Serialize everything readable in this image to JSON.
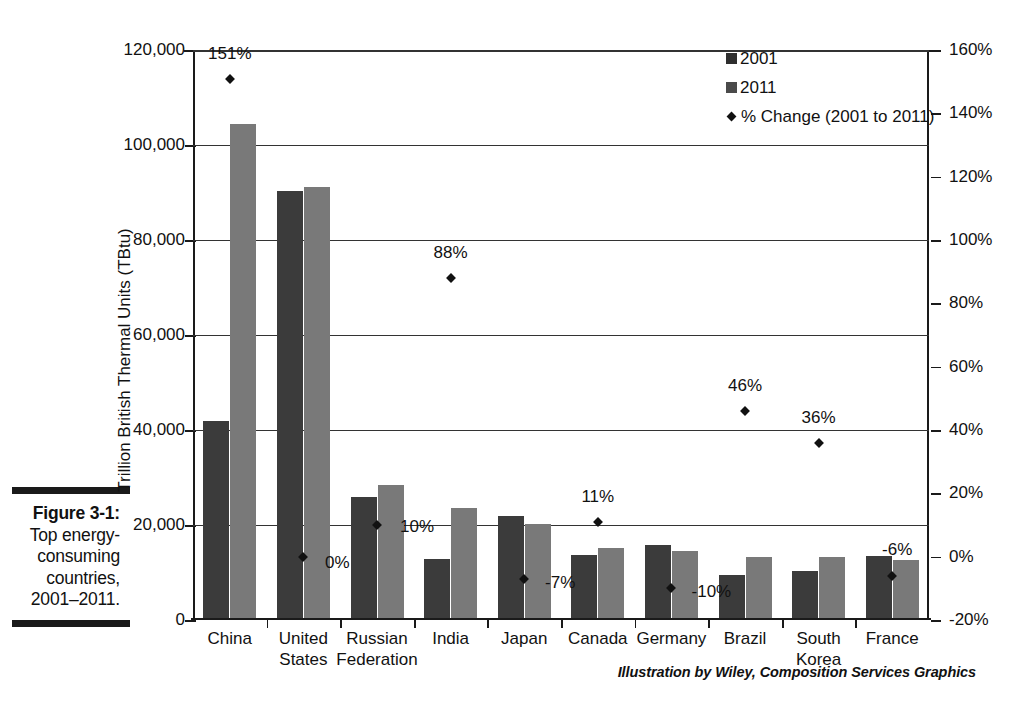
{
  "caption": {
    "figure_number": "Figure 3-1:",
    "lines": [
      "Top energy-",
      "consuming",
      "countries,",
      "2001–2011."
    ]
  },
  "credit": "Illustration by Wiley, Composition Services Graphics",
  "legend": {
    "items": [
      {
        "label": "2001",
        "type": "swatch-dark"
      },
      {
        "label": "2011",
        "type": "swatch-gray"
      },
      {
        "label": "% Change (2001 to 2011)",
        "type": "diamond"
      }
    ]
  },
  "axes": {
    "left_title": "Trillion British Thermal Units (TBtu)",
    "left_ticks": [
      "0",
      "20,000",
      "40,000",
      "60,000",
      "80,000",
      "100,000",
      "120,000"
    ],
    "right_ticks": [
      "-20%",
      "0%",
      "20%",
      "40%",
      "60%",
      "80%",
      "100%",
      "120%",
      "140%",
      "160%"
    ]
  },
  "chart_data": {
    "type": "bar",
    "xlabel": "",
    "ylabel": "Trillion British Thermal Units (TBtu)",
    "y2label": "% Change (2001 to 2011)",
    "ylim": [
      0,
      120000
    ],
    "y2lim": [
      -20,
      160
    ],
    "grid": true,
    "legend_position": "top-right",
    "categories": [
      "China",
      "United\nStates",
      "Russian\nFederation",
      "India",
      "Japan",
      "Canada",
      "Germany",
      "Brazil",
      "South\nKorea",
      "France"
    ],
    "series": [
      {
        "name": "2001",
        "type": "bar",
        "color": "#3b3b3b",
        "values": [
          41500,
          90000,
          25500,
          12500,
          21500,
          13200,
          15300,
          9000,
          9900,
          13100
        ]
      },
      {
        "name": "2011",
        "type": "bar",
        "color": "#797979",
        "values": [
          104000,
          90800,
          28000,
          23200,
          19800,
          14700,
          14100,
          12900,
          12900,
          12300
        ]
      },
      {
        "name": "% Change (2001 to 2011)",
        "type": "scatter",
        "axis": "right",
        "color": "#111111",
        "values": [
          151,
          0,
          10,
          88,
          -7,
          11,
          -10,
          46,
          36,
          -6
        ],
        "labels": [
          "151%",
          "0%",
          "10%",
          "88%",
          "-7%",
          "11%",
          "-10%",
          "46%",
          "36%",
          "-6%"
        ]
      }
    ]
  }
}
